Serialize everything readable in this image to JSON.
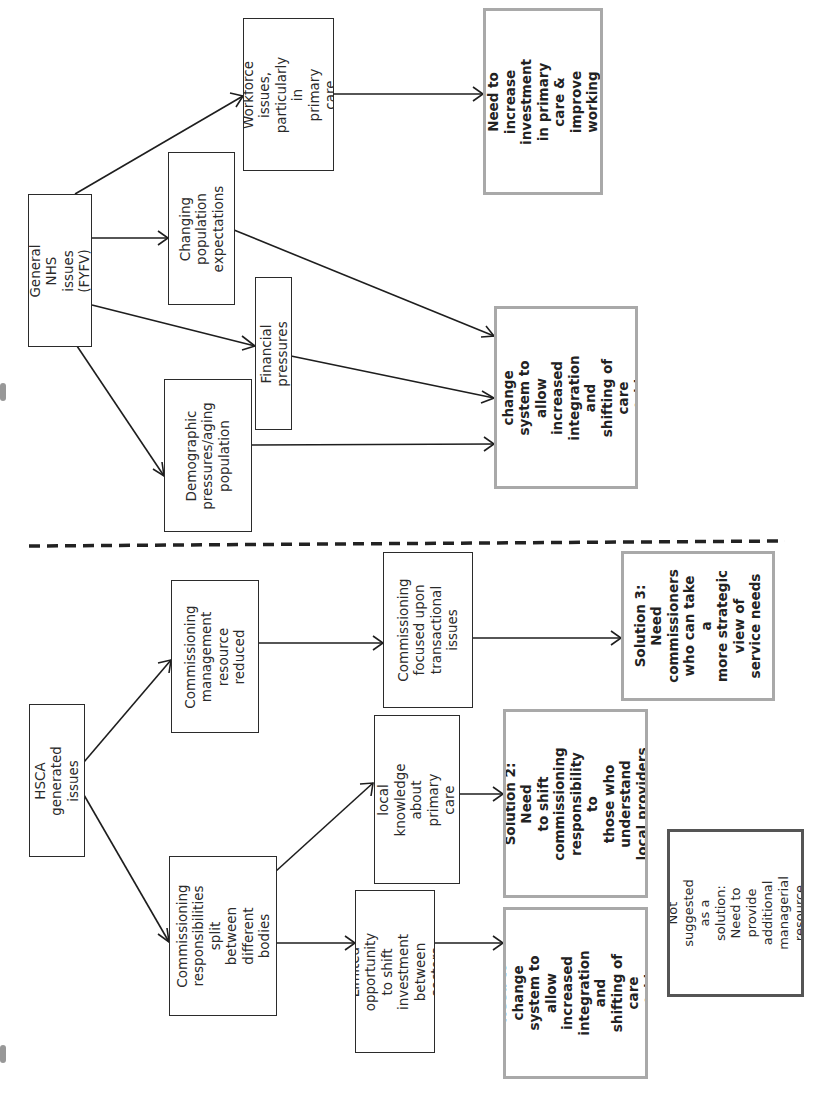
{
  "diagram": {
    "panels": [
      {
        "name": "General NHS issues panel",
        "nodes": {
          "general_nhs": "General NHS\nissues (FYFV)",
          "workforce": "Workforce issues,\nparticularly in\nprimary care",
          "changing_expectations": "Changing\npopulation\nexpectations",
          "financial": "Financial pressures",
          "demographic": "Demographic\npressures/aging\npopulation",
          "solution4": "Solution 4: Need to\nincrease investment\nin primary care &\nimprove working\nenvironment",
          "solution1": "Solution 1: Need to\nchange system to\nallow increased\nintegration and\nshifting of care\noutside hospitals"
        }
      },
      {
        "name": "HSCA generated issues panel",
        "nodes": {
          "hsca": "HSCA generated\nissues",
          "comm_mgmt": "Commissioning\nmanagement\nresource\nreduced",
          "comm_focused": "Commissioning\nfocused upon\ntransactional issues",
          "comm_split": "Commissioning\nresponsibilities split\nbetween different\nbodies",
          "loss_local": "Loss of local\nknowledge\nabout primary care\nproviders",
          "limited_opportunity": "Limited opportunity\nto shift investment\nbetween sectors",
          "solution3": "Solution 3: Need\ncommissioners\nwho can take a\nmore strategic\nview of\nservice needs",
          "solution2": "Solution 2: Need\nto shift\ncommissioning\nresponsibility to\nthose who understand\nlocal providers",
          "solution1": "Solution 1: Need to\nchange system to\nallow increased\nintegration and\nshifting of care\noutside hospitals",
          "not_suggested": "Not suggested as a\nsolution: Need to\nprovide additional\nmanagerial resource"
        }
      }
    ],
    "edges": [
      {
        "from": "General NHS issues (FYFV)",
        "to": "Workforce issues, particularly in primary care"
      },
      {
        "from": "General NHS issues (FYFV)",
        "to": "Changing population expectations"
      },
      {
        "from": "General NHS issues (FYFV)",
        "to": "Financial pressures"
      },
      {
        "from": "General NHS issues (FYFV)",
        "to": "Demographic pressures/aging population"
      },
      {
        "from": "Workforce issues, particularly in primary care",
        "to": "Solution 4"
      },
      {
        "from": "Changing population expectations",
        "to": "Solution 1"
      },
      {
        "from": "Financial pressures",
        "to": "Solution 1"
      },
      {
        "from": "Demographic pressures/aging population",
        "to": "Solution 1"
      },
      {
        "from": "HSCA generated issues",
        "to": "Commissioning management resource reduced"
      },
      {
        "from": "HSCA generated issues",
        "to": "Commissioning responsibilities split between different bodies"
      },
      {
        "from": "Commissioning management resource reduced",
        "to": "Commissioning focused upon transactional issues"
      },
      {
        "from": "Commissioning focused upon transactional issues",
        "to": "Solution 3"
      },
      {
        "from": "Commissioning responsibilities split between different bodies",
        "to": "Loss of local knowledge about primary care providers"
      },
      {
        "from": "Commissioning responsibilities split between different bodies",
        "to": "Limited opportunity to shift investment between sectors"
      },
      {
        "from": "Loss of local knowledge about primary care providers",
        "to": "Solution 2"
      },
      {
        "from": "Limited opportunity to shift investment between sectors",
        "to": "Solution 1"
      }
    ],
    "orientation": "rotated 90 degrees counter-clockwise",
    "colors": {
      "solution_border": "#a9a9a9",
      "not_suggested_border": "#555555",
      "issue_border": "#2b2b2b"
    }
  }
}
